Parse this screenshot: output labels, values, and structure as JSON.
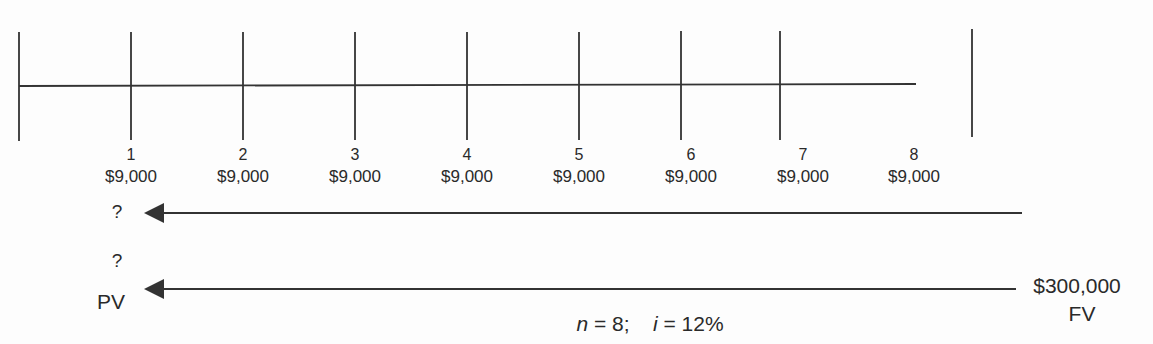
{
  "diagram": {
    "type": "cash-flow-timeline",
    "periods": [
      {
        "label": "1",
        "amount": "$9,000",
        "x": 131
      },
      {
        "label": "2",
        "amount": "$9,000",
        "x": 243
      },
      {
        "label": "3",
        "amount": "$9,000",
        "x": 355
      },
      {
        "label": "4",
        "amount": "$9,000",
        "x": 467
      },
      {
        "label": "5",
        "amount": "$9,000",
        "x": 579
      },
      {
        "label": "6",
        "amount": "$9,000",
        "x": 691
      },
      {
        "label": "7",
        "amount": "$9,000",
        "x": 803
      },
      {
        "label": "8",
        "amount": "$9,000",
        "x": 914
      }
    ],
    "arrow_annuity": {
      "unknown": "?"
    },
    "arrow_lumpsum": {
      "unknown": "?",
      "start_label": "PV",
      "end_value": "$300,000",
      "end_label": "FV"
    },
    "formula": {
      "n_var": "n",
      "n_val": " = 8;",
      "i_var": "i",
      "i_val": " = 12%"
    },
    "colors": {
      "line": "#333333",
      "text": "#2a2a2a"
    }
  }
}
